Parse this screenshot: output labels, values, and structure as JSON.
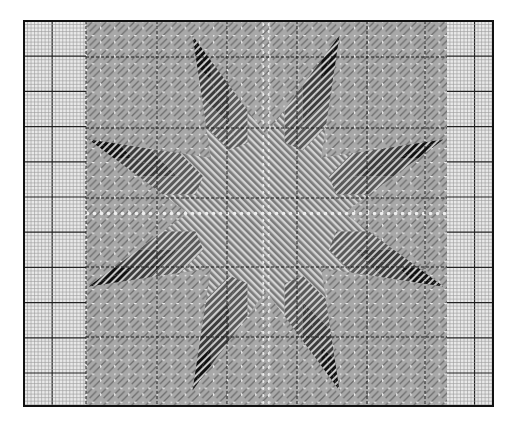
{
  "chart": {
    "title": "",
    "kind": "needlepoint-stitch-chart",
    "motif": "eight-pointed-star",
    "canvas": {
      "width": 514,
      "height": 435,
      "background": "#ffffff"
    },
    "frame": {
      "x": 24,
      "y": 21,
      "width": 469,
      "height": 385,
      "stroke": "#111111",
      "stroke_width": 2
    },
    "grid": {
      "minor_spacing": 3.52,
      "major_every": 10,
      "minor_color": "#9a9a9a",
      "major_color": "#222222",
      "fill": "#e9e9e9"
    },
    "pattern_area": {
      "x": 86,
      "y": 21,
      "width": 361,
      "height": 385
    },
    "center": {
      "x": 266,
      "y": 213
    },
    "colors": {
      "background_stitch": "#8c8c8c",
      "background_light": "#d8d8d8",
      "dot": "#efefef",
      "star_dark": "#111111",
      "star_mid": "#3c3c3c",
      "star_mid_light": "#5a5a5a",
      "star_light": "#7a7a7a",
      "dashed_line": "#1a1a1a"
    },
    "dashed_lines": {
      "x": [
        86,
        157,
        227,
        297,
        367,
        425
      ],
      "y": [
        57,
        128,
        198,
        267,
        337
      ]
    },
    "star": {
      "points": 8,
      "outer_radius": 192,
      "inner_radius": 78,
      "bands": [
        "star_dark",
        "star_mid",
        "star_mid_light",
        "star_light"
      ]
    }
  }
}
